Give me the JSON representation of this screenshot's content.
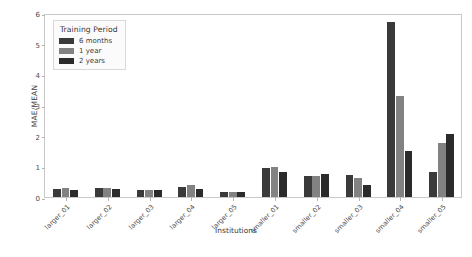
{
  "chart_data": {
    "type": "bar",
    "title": "",
    "xlabel": "Institutions",
    "ylabel": "MAE/MEAN",
    "ylim": [
      0,
      6
    ],
    "yticks": [
      0,
      1,
      2,
      3,
      4,
      5,
      6
    ],
    "grid": false,
    "legend_title": "Training Period",
    "legend_position": "upper left",
    "categories": [
      "larger_01",
      "larger_02",
      "larger_03",
      "larger_04",
      "larger_05",
      "smaller_01",
      "smaller_02",
      "smaller_03",
      "smaller_04",
      "smaller_05"
    ],
    "series": [
      {
        "name": "6 months",
        "color": "#3a3a3a",
        "values": [
          0.27,
          0.29,
          0.24,
          0.33,
          0.15,
          0.95,
          0.7,
          0.72,
          5.7,
          0.8
        ]
      },
      {
        "name": "1 year",
        "color": "#828282",
        "values": [
          0.31,
          0.28,
          0.24,
          0.4,
          0.17,
          0.97,
          0.68,
          0.62,
          3.3,
          1.75
        ]
      },
      {
        "name": "2 years",
        "color": "#2b2b2b",
        "values": [
          0.22,
          0.25,
          0.22,
          0.27,
          0.15,
          0.8,
          0.75,
          0.38,
          1.5,
          2.05
        ]
      }
    ]
  },
  "style": {
    "background": "#ffffff",
    "frame_color": "#c9c9c9",
    "tick_color": "#b5b5b5",
    "text_color": "#3c3c3c"
  }
}
